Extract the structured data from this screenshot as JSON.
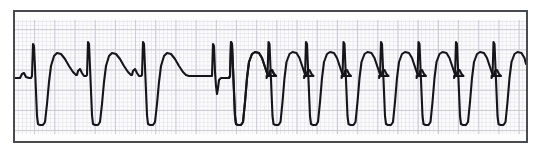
{
  "document": {
    "kind": "ecg-rhythm-strip",
    "width": 539,
    "height": 153,
    "background_color": "#ffffff"
  },
  "strip": {
    "border_color": "#4a4a52",
    "paper_color": "#fcfcfc",
    "fine_grid_color": "#e8e8ee",
    "major_grid_color": "#c9c9d2",
    "trace_color": "#15151a",
    "left": 13,
    "top": 10,
    "width": 515,
    "height": 133
  },
  "chart_data": {
    "type": "line",
    "title": "",
    "xlabel": "",
    "ylabel": "",
    "grid": true,
    "legend": null,
    "xlim": [
      0,
      511
    ],
    "ylim": [
      129,
      0
    ],
    "axis_note": "y inverted: smaller y = higher voltage deflection",
    "baseline_y": 65,
    "fine_grid_px": 4.04,
    "major_grid_px": 20.2,
    "segments": [
      {
        "name": "sinus-with-wide-ectopic-beats",
        "beat_count": 3,
        "beat_interval_px": 47,
        "first_beat_x": 17
      },
      {
        "name": "isoelectric-pause",
        "start_x": 148,
        "end_x": 168
      },
      {
        "name": "narrow-conducted-beat",
        "x": 172
      },
      {
        "name": "wide-complex-tachycardia-run",
        "beat_count": 9,
        "beat_interval_px": 37.5,
        "first_beat_x": 196
      }
    ],
    "waveform_points": "see trace path in markup",
    "series": [
      {
        "name": "lead-trace",
        "path": "M 0,65 L 6,65 L 8,61 L 10,60 L 12,64 L 14,65 L 16,65 L 17,62 L 18,31 L 19,33 L 20,60 L 21,78 L 22,108 L 24,112 L 27,113 L 29,110 L 31,86 L 33,62 L 35,48 L 38,40 L 41,38 L 45,39 L 49,44 L 53,52 L 57,59 L 60,62 L 62,63 L 63,59 L 65,57 L 67,61 L 69,63 L 71,63 L 63.5,63 L 64,63 L 64,63 L 64,63 L 64,63 L 64,63 L 64,63 L 64,63 L 64,63 L 64,63 L 64,63 L 64,63 L 64,63 L 64,63 L 64,63 L 64,63 L 64,63 L 64,63 L 64,63 L 64,63 L 64,63 Z"
      }
    ]
  },
  "annotations": {
    "visible_text": []
  }
}
